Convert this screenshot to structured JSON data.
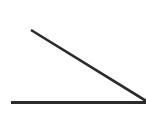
{
  "figure": {
    "background_color": "#ffffff",
    "width": 146,
    "height": 130,
    "stroke_color": "#2b2b2b",
    "shapes": [
      {
        "name": "diagonal-ray",
        "type": "line",
        "x1": 31,
        "y1": 30,
        "x2": 147,
        "y2": 101.5,
        "stroke_width": 2.6,
        "label": "Descending ray"
      },
      {
        "name": "horizontal-ray",
        "type": "line",
        "x1": 11,
        "y1": 102.5,
        "x2": 147,
        "y2": 102.5,
        "stroke_width": 3,
        "label": "Base ray"
      }
    ],
    "vertex": {
      "x": 146,
      "y": 102,
      "label": "Angle vertex at right edge"
    }
  },
  "chart_data": {
    "type": "line",
    "xlabel": "",
    "ylabel": "",
    "xlim": [
      0,
      146
    ],
    "ylim": [
      0,
      130
    ],
    "grid": false,
    "legend": "none",
    "series": [
      {
        "name": "Descending ray",
        "x": [
          31,
          147
        ],
        "y": [
          30,
          101.5
        ]
      },
      {
        "name": "Base ray",
        "x": [
          11,
          147
        ],
        "y": [
          102.5,
          102.5
        ]
      }
    ],
    "annotations": [
      {
        "text": "vertex",
        "x": 146,
        "y": 102
      }
    ]
  }
}
